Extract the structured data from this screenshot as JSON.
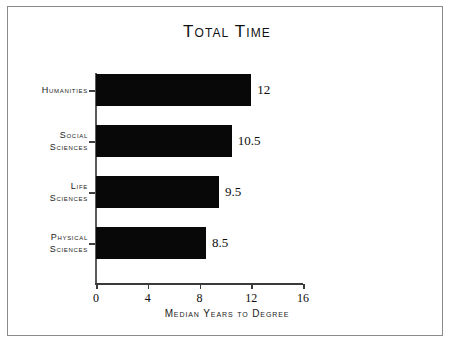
{
  "chart_data": {
    "type": "bar",
    "orientation": "horizontal",
    "title": "Total Time",
    "xlabel": "Median Years to Degree",
    "ylabel": "",
    "categories": [
      "Humanities",
      "Social Sciences",
      "Life Sciences",
      "Physical Sciences"
    ],
    "category_lines": [
      [
        "Humanities"
      ],
      [
        "Social",
        "Sciences"
      ],
      [
        "Life",
        "Sciences"
      ],
      [
        "Physical",
        "Sciences"
      ]
    ],
    "values": [
      12,
      10.5,
      9.5,
      8.5
    ],
    "value_labels": [
      "12",
      "10.5",
      "9.5",
      "8.5"
    ],
    "xlim": [
      0,
      16
    ],
    "xticks": [
      0,
      4,
      8,
      12,
      16
    ],
    "xtick_labels": [
      "0",
      "4",
      "8",
      "12",
      "16"
    ],
    "grid": false,
    "legend": null,
    "bar_color": "#080808",
    "axis_color": "#3a3a3a",
    "background_color": "#ffffff",
    "frame_color": "#8a8a8a"
  }
}
